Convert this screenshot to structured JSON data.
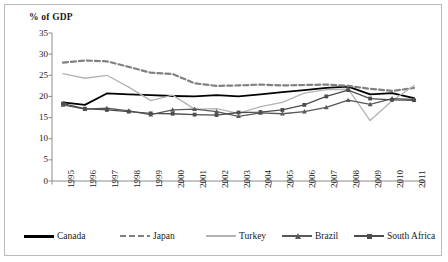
{
  "chart": {
    "title": "% of GDP",
    "frame_border_color": "#b9b9b9"
  },
  "chart_data": {
    "type": "line",
    "title": "% of GDP",
    "xlabel": "",
    "ylabel": "% of GDP",
    "ylim": [
      0,
      35
    ],
    "yticks": [
      0,
      5,
      10,
      15,
      20,
      25,
      30,
      35
    ],
    "grid": false,
    "legend_position": "bottom",
    "categories": [
      "1995",
      "1996",
      "1997",
      "1998",
      "1999",
      "2000",
      "2001",
      "2002",
      "2003",
      "2004",
      "2005",
      "2006",
      "2007",
      "2008",
      "2009",
      "2010",
      "2011"
    ],
    "series": [
      {
        "name": "Canada",
        "color": "#000000",
        "style": "solid",
        "marker": "none",
        "values": [
          18.6,
          18.0,
          20.7,
          20.5,
          20.3,
          20.1,
          20.0,
          20.3,
          20.0,
          20.5,
          21.0,
          21.5,
          22.0,
          22.3,
          20.5,
          20.8,
          19.6
        ]
      },
      {
        "name": "Japan",
        "color": "#808080",
        "style": "dashed",
        "marker": "none",
        "values": [
          28.0,
          28.5,
          28.3,
          27.0,
          25.6,
          25.3,
          23.1,
          22.5,
          22.6,
          22.8,
          22.6,
          22.7,
          22.8,
          22.5,
          21.8,
          21.3,
          22.0
        ]
      },
      {
        "name": "Turkey",
        "color": "#b3b3b3",
        "style": "solid",
        "marker": "none",
        "values": [
          25.4,
          24.3,
          25.0,
          22.2,
          19.0,
          20.3,
          17.0,
          17.1,
          16.0,
          17.6,
          18.6,
          20.8,
          21.6,
          21.7,
          14.3,
          19.0,
          22.6
        ]
      },
      {
        "name": "Brazil",
        "color": "#595959",
        "style": "solid",
        "marker": "triangle",
        "values": [
          18.0,
          17.0,
          17.2,
          16.6,
          15.7,
          16.8,
          17.0,
          16.4,
          15.3,
          16.1,
          15.9,
          16.4,
          17.4,
          19.1,
          18.1,
          19.5,
          19.3
        ]
      },
      {
        "name": "South Africa",
        "color": "#4d4d4d",
        "style": "solid",
        "marker": "square",
        "values": [
          18.3,
          17.1,
          16.8,
          16.4,
          16.0,
          15.9,
          15.7,
          15.6,
          16.2,
          16.3,
          16.8,
          18.0,
          20.0,
          21.5,
          19.5,
          19.2,
          19.1
        ]
      }
    ]
  },
  "legend": [
    {
      "label": "Canada",
      "color": "#000000",
      "style": "solid",
      "marker": "none"
    },
    {
      "label": "Japan",
      "color": "#808080",
      "style": "dashed",
      "marker": "none"
    },
    {
      "label": "Turkey",
      "color": "#b3b3b3",
      "style": "solid",
      "marker": "none"
    },
    {
      "label": "Brazil",
      "color": "#595959",
      "style": "solid",
      "marker": "triangle"
    },
    {
      "label": "South Africa",
      "color": "#4d4d4d",
      "style": "solid",
      "marker": "square"
    }
  ]
}
